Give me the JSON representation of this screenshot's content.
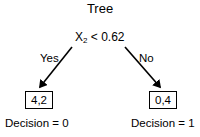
{
  "title": "Tree",
  "root": {
    "variable": "X",
    "subscript": "2",
    "operator": "<",
    "threshold": "0.62"
  },
  "edges": {
    "left_label": "Yes",
    "right_label": "No"
  },
  "leaves": [
    {
      "counts": "4,2",
      "decision": "Decision = 0"
    },
    {
      "counts": "0,4",
      "decision": "Decision = 1"
    }
  ]
}
